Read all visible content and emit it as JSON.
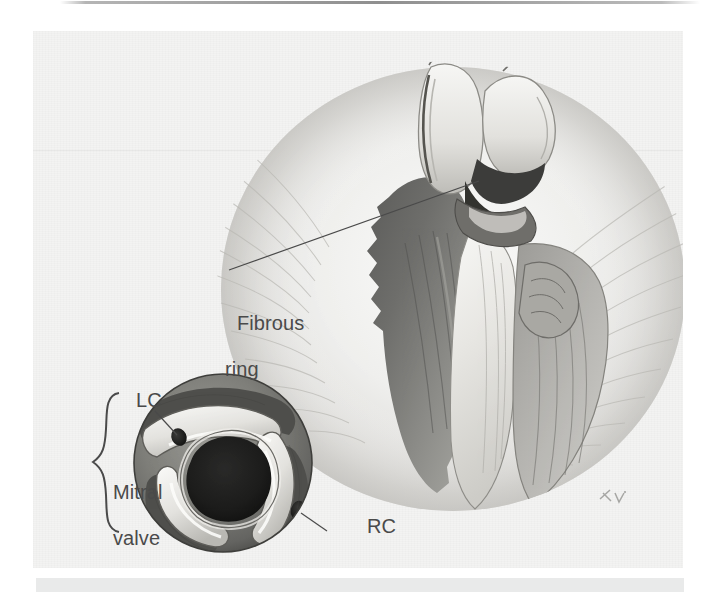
{
  "figure": {
    "kind": "anatomical-illustration",
    "medium": "grayscale wash and ink drawing, scanned textbook plate",
    "background_color": "#f3f3f2",
    "ink_color": "#4a4a4a",
    "page_top_line_color": "#696969",
    "page_bottom_bar_color": "#e9eaea"
  },
  "labels": {
    "fibrous_ring": {
      "line1": "Fibrous",
      "line2": "ring",
      "leader": "line from text up-right to the fibrous ring between the cut chambers"
    },
    "lc": {
      "text": "LC",
      "meaning_marker": "left coronary ostium",
      "leader": "short line down-right to dark ostium in upper-left cusp"
    },
    "rc": {
      "text": "RC",
      "meaning_marker": "right coronary ostium",
      "leader": "short line up-left to dark ostium in right cusp"
    },
    "mitral_valve_area": {
      "line1": "Mitral",
      "line2": "valve",
      "line3": "area",
      "brace": "curly brace opening right, spanning the left side of the inset"
    }
  },
  "inset": {
    "name": "aortic-valve-superior-view",
    "description": "circular superior view of the aortic valve with three semilunar cusps, dark central orifice and two coronary ostia",
    "cusp_count": 3,
    "ostia": [
      "LC",
      "RC"
    ]
  },
  "main_view": {
    "name": "opened-heart-longitudinal",
    "description": "longitudinally opened heart showing aortic valve cusps above, fibrous ring at the annulus, and the cut ventricular chamber below",
    "signature": "artist monogram, lower right"
  }
}
